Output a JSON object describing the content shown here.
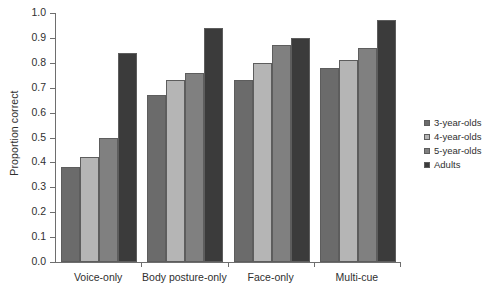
{
  "chart_data": {
    "type": "bar",
    "title": "",
    "xlabel": "",
    "ylabel": "Proportion correct",
    "ylim": [
      0.0,
      1.0
    ],
    "ytick_labels": [
      "0.0",
      "0.1",
      "0.2",
      "0.3",
      "0.4",
      "0.5",
      "0.6",
      "0.7",
      "0.8",
      "0.9",
      "1.0"
    ],
    "ytick_values": [
      0.0,
      0.1,
      0.2,
      0.3,
      0.4,
      0.5,
      0.6,
      0.7,
      0.8,
      0.9,
      1.0
    ],
    "grid": false,
    "legend_position": "right",
    "categories": [
      "Voice-only",
      "Body posture-only",
      "Face-only",
      "Multi-cue"
    ],
    "series": [
      {
        "name": "3-year-olds",
        "color": "#6b6b6b",
        "values": [
          0.38,
          0.67,
          0.73,
          0.78
        ]
      },
      {
        "name": "4-year-olds",
        "color": "#b5b5b5",
        "values": [
          0.42,
          0.73,
          0.8,
          0.81
        ]
      },
      {
        "name": "5-year-olds",
        "color": "#808080",
        "values": [
          0.5,
          0.76,
          0.87,
          0.86
        ]
      },
      {
        "name": "Adults",
        "color": "#3b3b3b",
        "values": [
          0.84,
          0.94,
          0.9,
          0.97
        ]
      }
    ]
  }
}
